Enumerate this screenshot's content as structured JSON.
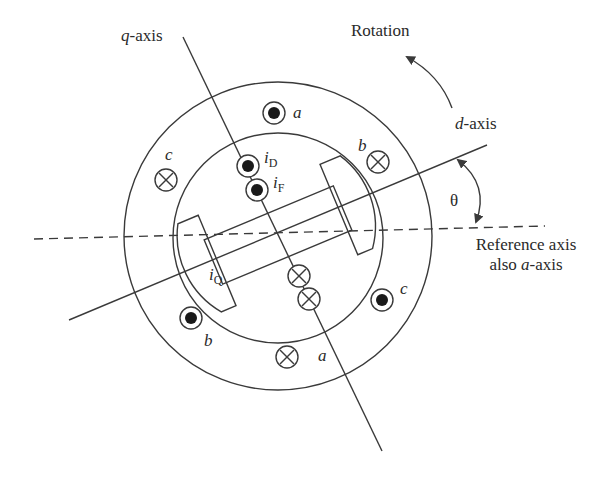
{
  "diagram": {
    "type": "synchronous machine cross-section with dq axes",
    "labels": {
      "q_axis": {
        "var": "q",
        "suffix": "-axis"
      },
      "d_axis": {
        "var": "d",
        "suffix": "-axis"
      },
      "rotation": "Rotation",
      "theta": "θ",
      "reference_line1": "Reference axis",
      "reference_line2_prefix": "also ",
      "reference_line2_var": "a",
      "reference_line2_suffix": "-axis"
    },
    "currents": {
      "iD": {
        "sym": "i",
        "sub": "D"
      },
      "iF": {
        "sym": "i",
        "sub": "F"
      },
      "iQ": {
        "sym": "i",
        "sub": "Q"
      }
    },
    "stator_coils": [
      {
        "phase": "a",
        "direction": "out",
        "symbol": "dot"
      },
      {
        "phase": "a",
        "direction": "in",
        "symbol": "cross"
      },
      {
        "phase": "b",
        "direction": "in",
        "symbol": "cross"
      },
      {
        "phase": "b",
        "direction": "out",
        "symbol": "dot"
      },
      {
        "phase": "c",
        "direction": "in",
        "symbol": "cross"
      },
      {
        "phase": "c",
        "direction": "out",
        "symbol": "dot"
      }
    ],
    "phase_labels": {
      "a": "a",
      "b": "b",
      "c": "c"
    },
    "colors": {
      "line": "#3a3a3a",
      "text": "#2a2a2a",
      "background": "#ffffff"
    }
  }
}
